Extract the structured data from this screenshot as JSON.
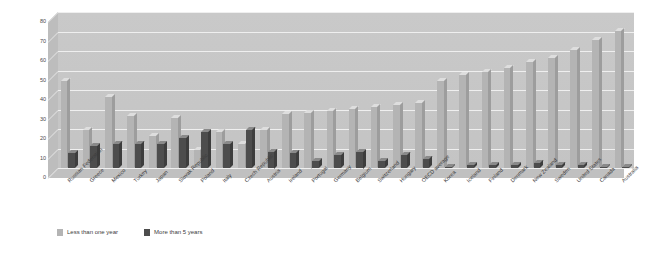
{
  "chart_data": {
    "type": "bar",
    "title": "",
    "subtitle": "",
    "xlabel": "",
    "ylabel": "",
    "ylim": [
      0,
      80
    ],
    "ytick_step": 10,
    "yticks": [
      0,
      10,
      20,
      30,
      40,
      50,
      60,
      70,
      80
    ],
    "grid": true,
    "legend_position": "bottom-left",
    "categories": [
      "Russian Federation",
      "Greece",
      "Mexico",
      "Turkey",
      "Japan",
      "Slovak Republic",
      "Poland",
      "Italy",
      "Czech Republic",
      "Austria",
      "Ireland",
      "Portugal",
      "Germany",
      "Belgium",
      "Switzerland",
      "Hungary",
      "OECD average",
      "Korea",
      "Iceland",
      "Finland",
      "Denmark",
      "New Zealand",
      "Sweden",
      "United States",
      "Canada",
      "Australia"
    ],
    "series": [
      {
        "name": "Less than one year",
        "color": "#b4b4b4",
        "values": [
          46,
          21,
          38,
          28,
          18,
          27,
          11,
          20,
          14,
          21,
          29,
          30,
          31,
          32,
          33,
          34,
          35,
          46,
          49,
          51,
          53,
          56,
          58,
          62,
          67,
          72
        ]
      },
      {
        "name": "More than 5 years",
        "color": "#4d4d4d",
        "values": [
          9,
          13,
          14,
          14,
          14,
          17,
          20,
          14,
          21,
          10,
          9,
          5,
          8,
          10,
          5,
          8,
          6,
          2,
          3,
          3,
          3,
          4,
          3,
          3,
          2,
          2
        ]
      }
    ]
  },
  "legend": {
    "items": [
      {
        "label": "Less than one year",
        "color": "#b4b4b4"
      },
      {
        "label": "More than 5 years",
        "color": "#4d4d4d"
      }
    ]
  },
  "colors": {
    "plot_background": "#c6c6c6",
    "gridline": "#efefef",
    "axis_text": "#4a4a4a",
    "page_background": "#ffffff"
  }
}
